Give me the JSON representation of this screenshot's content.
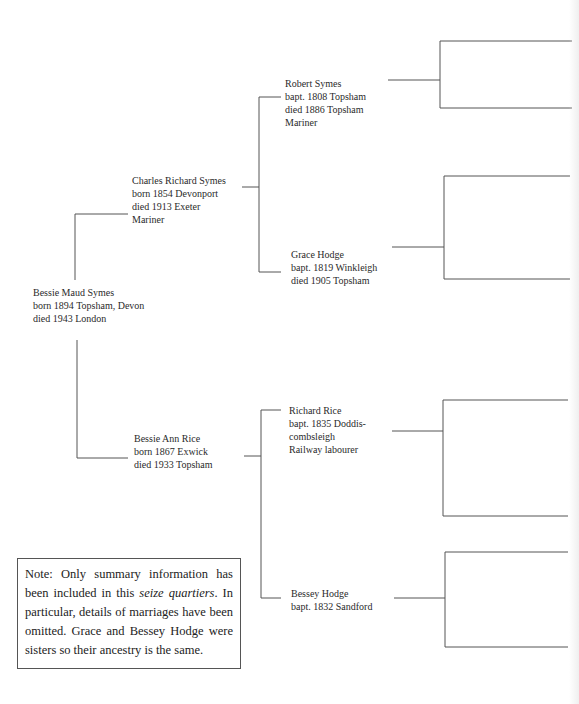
{
  "tree": {
    "subject": {
      "name": "Bessie Maud Symes",
      "line2": "born 1894 Topsham, Devon",
      "line3": "died 1943 London"
    },
    "father": {
      "name": "Charles Richard Symes",
      "line2": "born 1854 Devonport",
      "line3": "died 1913 Exeter",
      "line4": "Mariner"
    },
    "mother": {
      "name": "Bessie Ann Rice",
      "line2": "born 1867 Exwick",
      "line3": "died 1933 Topsham"
    },
    "paternal_grandfather": {
      "name": "Robert Symes",
      "line2": "bapt. 1808 Topsham",
      "line3": "died 1886 Topsham",
      "line4": "Mariner"
    },
    "paternal_grandmother": {
      "name": "Grace Hodge",
      "line2": "bapt. 1819 Winkleigh",
      "line3": "died 1905 Topsham"
    },
    "maternal_grandfather": {
      "name": "Richard Rice",
      "line2": "bapt. 1835 Doddis-",
      "line3": "combsleigh",
      "line4": "Railway labourer"
    },
    "maternal_grandmother": {
      "name": "Bessey Hodge",
      "line2": "bapt. 1832 Sandford"
    }
  },
  "note": {
    "part1": "Note: Only summary information has been included in this ",
    "italic": "seize quartiers",
    "part2": ". In particular, details of marriages have been omitted. Grace and Bessey Hodge were sisters so their ancestry is the same."
  },
  "colors": {
    "line": "#555555",
    "text": "#2a2a2a",
    "background": "#ffffff"
  }
}
